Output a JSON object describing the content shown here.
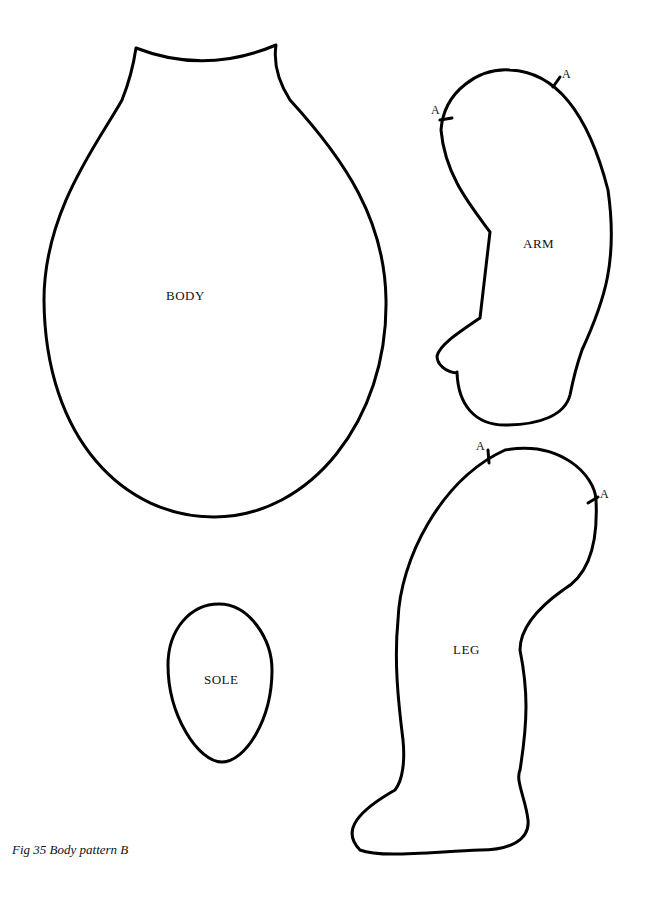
{
  "figure": {
    "caption": "Fig  35 Body pattern B",
    "pieces": {
      "body": {
        "label": "BODY"
      },
      "arm": {
        "label": "ARM",
        "marks": [
          "A",
          "A"
        ]
      },
      "leg": {
        "label": "LEG",
        "marks": [
          "A",
          "A"
        ]
      },
      "sole": {
        "label": "SOLE"
      }
    }
  }
}
